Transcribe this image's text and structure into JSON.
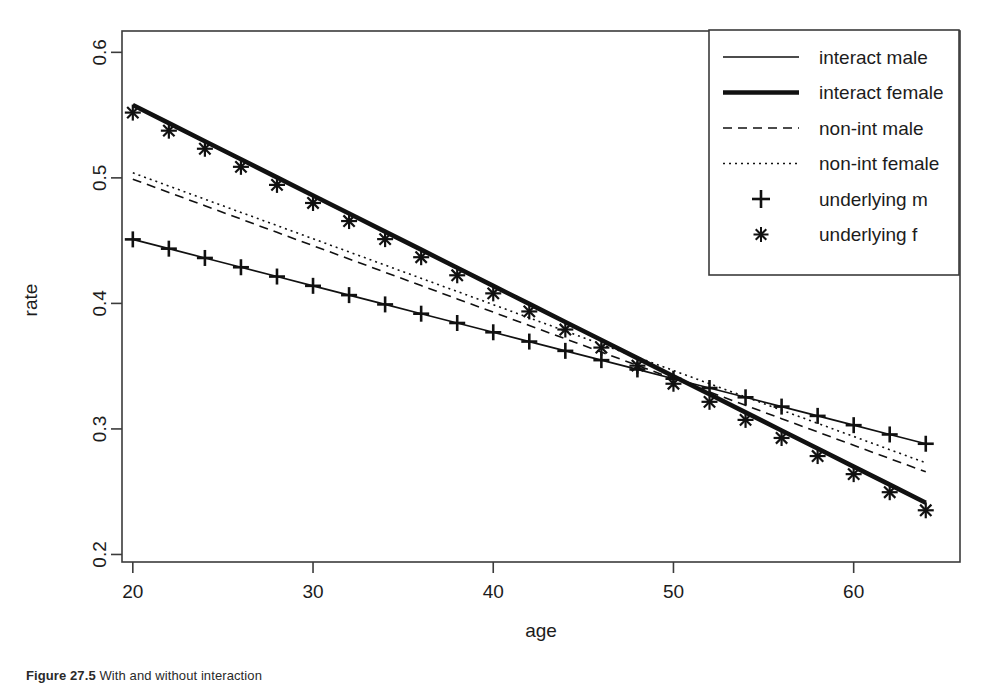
{
  "figure": {
    "caption_number": "Figure 27.5",
    "caption_text": "With and without interaction",
    "xlabel": "age",
    "ylabel": "rate"
  },
  "axes": {
    "x_ticks": [
      "20",
      "30",
      "40",
      "50",
      "60"
    ],
    "y_ticks": [
      "0.2",
      "0.3",
      "0.4",
      "0.5",
      "0.6"
    ]
  },
  "legend": {
    "entries": [
      {
        "label": "interact male",
        "key": "interact_male",
        "style": "solid-thin"
      },
      {
        "label": "interact female",
        "key": "interact_female",
        "style": "solid-thick"
      },
      {
        "label": "non-int male",
        "key": "nonint_male",
        "style": "dashed"
      },
      {
        "label": "non-int female",
        "key": "nonint_female",
        "style": "dotted"
      },
      {
        "label": "underlying m",
        "key": "underlying_m",
        "style": "plus-marker"
      },
      {
        "label": "underlying f",
        "key": "underlying_f",
        "style": "star-marker"
      }
    ]
  },
  "chart_data": {
    "type": "line",
    "title": "",
    "xlabel": "age",
    "ylabel": "rate",
    "xlim": [
      19.4,
      65.9
    ],
    "ylim": [
      0.194,
      0.617
    ],
    "xticks": [
      20,
      30,
      40,
      50,
      60
    ],
    "yticks": [
      0.2,
      0.3,
      0.4,
      0.5,
      0.6
    ],
    "grid": false,
    "legend_position": "top-right",
    "x": [
      20,
      22,
      24,
      26,
      28,
      30,
      32,
      34,
      36,
      38,
      40,
      42,
      44,
      46,
      48,
      50,
      52,
      54,
      56,
      58,
      60,
      62,
      64
    ],
    "series": [
      {
        "name": "interact male",
        "style": "solid-thin",
        "values": [
          0.451,
          0.4436,
          0.4362,
          0.4288,
          0.4214,
          0.414,
          0.4066,
          0.3992,
          0.3918,
          0.3844,
          0.377,
          0.3696,
          0.3622,
          0.3548,
          0.3474,
          0.34,
          0.3326,
          0.3252,
          0.3178,
          0.3104,
          0.303,
          0.2956,
          0.2882
        ]
      },
      {
        "name": "interact female",
        "style": "solid-thick",
        "values": [
          0.558,
          0.5436,
          0.5292,
          0.5148,
          0.5004,
          0.486,
          0.4716,
          0.4572,
          0.4428,
          0.4284,
          0.414,
          0.3996,
          0.3852,
          0.3708,
          0.3564,
          0.342,
          0.3276,
          0.3132,
          0.2988,
          0.2844,
          0.27,
          0.2556,
          0.2412
        ]
      },
      {
        "name": "non-int male",
        "style": "dashed",
        "values": [
          0.499,
          0.4884,
          0.4778,
          0.4672,
          0.4566,
          0.446,
          0.4354,
          0.4248,
          0.4142,
          0.4036,
          0.393,
          0.3824,
          0.3718,
          0.3612,
          0.3506,
          0.34,
          0.3294,
          0.3188,
          0.3082,
          0.2976,
          0.287,
          0.2764,
          0.2658
        ]
      },
      {
        "name": "non-int female",
        "style": "dotted",
        "values": [
          0.504,
          0.4935,
          0.483,
          0.4725,
          0.462,
          0.4515,
          0.441,
          0.4305,
          0.42,
          0.4095,
          0.399,
          0.3885,
          0.378,
          0.3675,
          0.357,
          0.3465,
          0.336,
          0.3255,
          0.315,
          0.3045,
          0.294,
          0.2835,
          0.273
        ]
      },
      {
        "name": "underlying m",
        "style": "plus-marker",
        "values": [
          0.451,
          0.4436,
          0.4362,
          0.4288,
          0.4214,
          0.414,
          0.4066,
          0.3992,
          0.3918,
          0.3844,
          0.377,
          0.3696,
          0.3622,
          0.3548,
          0.3474,
          0.34,
          0.3326,
          0.3252,
          0.3178,
          0.3104,
          0.303,
          0.2956,
          0.2882
        ]
      },
      {
        "name": "underlying f",
        "style": "star-marker",
        "values": [
          0.552,
          0.5376,
          0.5232,
          0.5088,
          0.4944,
          0.48,
          0.4656,
          0.4512,
          0.4368,
          0.4224,
          0.408,
          0.3936,
          0.3792,
          0.3648,
          0.3504,
          0.336,
          0.3216,
          0.3072,
          0.2928,
          0.2784,
          0.264,
          0.2496,
          0.2352
        ]
      }
    ]
  }
}
